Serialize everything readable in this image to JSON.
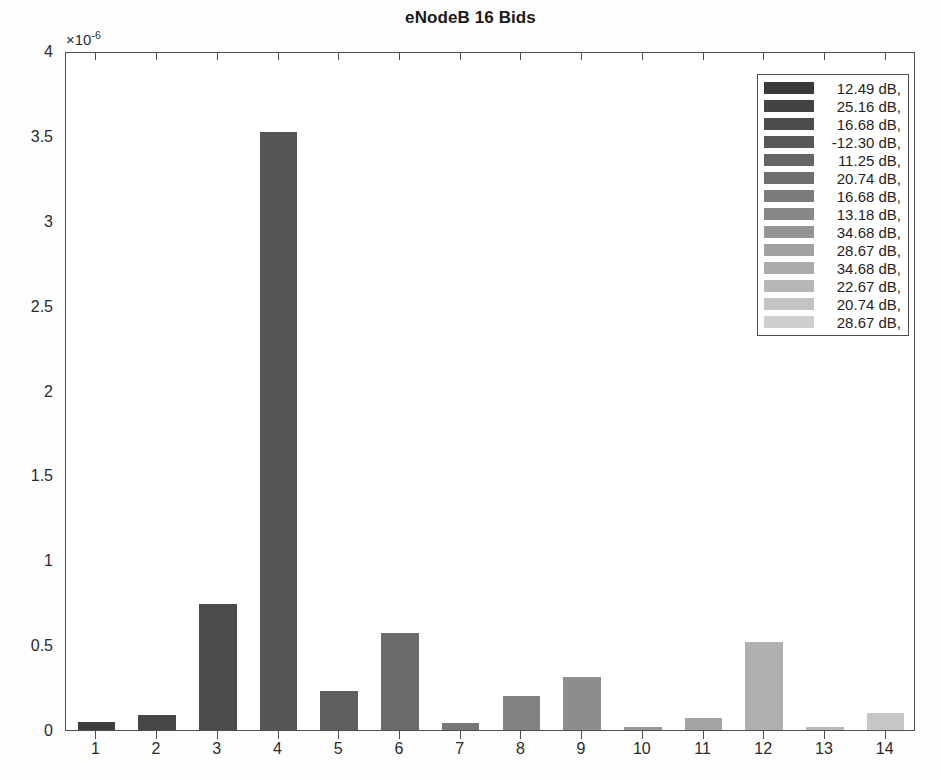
{
  "chart_data": {
    "type": "bar",
    "title": "eNodeB 16 Bids",
    "xlabel": "",
    "ylabel": "",
    "y_exponent_label": "×10",
    "y_exponent_power": "-6",
    "y_scale": 1e-06,
    "categories": [
      "1",
      "2",
      "3",
      "4",
      "5",
      "6",
      "7",
      "8",
      "9",
      "10",
      "11",
      "12",
      "13",
      "14"
    ],
    "values": [
      0.05,
      0.09,
      0.74,
      3.52,
      0.23,
      0.57,
      0.04,
      0.2,
      0.31,
      0.02,
      0.07,
      0.52,
      0.02,
      0.1
    ],
    "ylim": [
      0,
      4
    ],
    "yticks": [
      0,
      0.5,
      1,
      1.5,
      2,
      2.5,
      3,
      3.5,
      4
    ],
    "ytick_labels": [
      "0",
      "0.5",
      "1",
      "1.5",
      "2",
      "2.5",
      "3",
      "3.5",
      "4"
    ],
    "xticks": [
      "1",
      "2",
      "3",
      "4",
      "5",
      "6",
      "7",
      "8",
      "9",
      "10",
      "11",
      "12",
      "13",
      "14"
    ],
    "grid": false,
    "legend_position": "top-right",
    "bar_colors": [
      "#3d3d3d",
      "#464646",
      "#4b4b4b",
      "#555555",
      "#5f5f5f",
      "#6b6b6b",
      "#777777",
      "#828282",
      "#8d8d8d",
      "#999999",
      "#a4a4a4",
      "#b0b0b0",
      "#bbbbbb",
      "#c6c6c6"
    ],
    "legend_entries": [
      {
        "label": "12.49 dB,",
        "color": "#3a3a3a"
      },
      {
        "label": "25.16 dB,",
        "color": "#434343"
      },
      {
        "label": "16.68 dB,",
        "color": "#4d4d4d"
      },
      {
        "label": "-12.30 dB,",
        "color": "#585858"
      },
      {
        "label": "11.25 dB,",
        "color": "#646464"
      },
      {
        "label": "20.74 dB,",
        "color": "#707070"
      },
      {
        "label": "16.68 dB,",
        "color": "#7c7c7c"
      },
      {
        "label": "13.18 dB,",
        "color": "#888888"
      },
      {
        "label": "34.68 dB,",
        "color": "#949494"
      },
      {
        "label": "28.67 dB,",
        "color": "#a0a0a0"
      },
      {
        "label": "34.68 dB,",
        "color": "#ababab"
      },
      {
        "label": "22.67 dB,",
        "color": "#b7b7b7"
      },
      {
        "label": "20.74 dB,",
        "color": "#c3c3c3"
      },
      {
        "label": "28.67 dB,",
        "color": "#cfcfcf"
      }
    ],
    "axis_color": "#4d4d4d",
    "background_color": "#ffffff"
  }
}
